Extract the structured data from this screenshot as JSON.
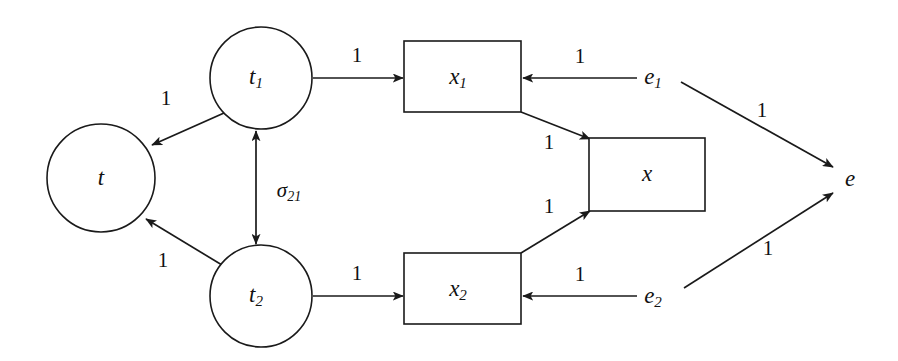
{
  "diagram": {
    "background_color": "#ffffff",
    "stroke_color": "#1a1a1a",
    "nodes": [
      {
        "id": "t",
        "shape": "circle",
        "label": "t",
        "sub": "",
        "cx": 101,
        "cy": 178,
        "r": 54
      },
      {
        "id": "t1",
        "shape": "circle",
        "label": "t",
        "sub": "1",
        "cx": 261,
        "cy": 78,
        "r": 51
      },
      {
        "id": "t2",
        "shape": "circle",
        "label": "t",
        "sub": "2",
        "cx": 261,
        "cy": 296,
        "r": 51
      },
      {
        "id": "x1",
        "shape": "rectangle",
        "label": "x",
        "sub": "1",
        "x": 404,
        "y": 41,
        "w": 117,
        "h": 71
      },
      {
        "id": "x",
        "shape": "rectangle",
        "label": "x",
        "sub": "",
        "x": 589,
        "y": 138,
        "w": 116,
        "h": 73
      },
      {
        "id": "x2",
        "shape": "rectangle",
        "label": "x",
        "sub": "2",
        "x": 404,
        "y": 253,
        "w": 117,
        "h": 71
      },
      {
        "id": "e1",
        "shape": "text",
        "label": "e",
        "sub": "1",
        "cx": 657,
        "cy": 78
      },
      {
        "id": "e2",
        "shape": "text",
        "label": "e",
        "sub": "2",
        "cx": 657,
        "cy": 297
      },
      {
        "id": "e",
        "shape": "text",
        "label": "e",
        "sub": "",
        "cx": 850,
        "cy": 180
      }
    ],
    "edges": [
      {
        "id": "t1-to-t",
        "from": "t1",
        "to": "t",
        "label": "1",
        "sub": "",
        "label_x": 166,
        "label_y": 100,
        "arrows": "end"
      },
      {
        "id": "t2-to-t",
        "from": "t2",
        "to": "t",
        "label": "1",
        "sub": "",
        "label_x": 163,
        "label_y": 262,
        "arrows": "end"
      },
      {
        "id": "t2-to-t1",
        "from": "t2",
        "to": "t1",
        "label": "σ",
        "sub": "21",
        "label_x": 289,
        "label_y": 192,
        "arrows": "both"
      },
      {
        "id": "t1-to-x1",
        "from": "t1",
        "to": "x1",
        "label": "1",
        "sub": "",
        "label_x": 357,
        "label_y": 57,
        "arrows": "end"
      },
      {
        "id": "t2-to-x2",
        "from": "t2",
        "to": "x2",
        "label": "1",
        "sub": "",
        "label_x": 357,
        "label_y": 275,
        "arrows": "end"
      },
      {
        "id": "e1-to-x1",
        "from": "e1",
        "to": "x1",
        "label": "1",
        "sub": "",
        "label_x": 580,
        "label_y": 58,
        "arrows": "end"
      },
      {
        "id": "e2-to-x2",
        "from": "e2",
        "to": "x2",
        "label": "1",
        "sub": "",
        "label_x": 580,
        "label_y": 276,
        "arrows": "end"
      },
      {
        "id": "x1-to-x",
        "from": "x1",
        "to": "x",
        "label": "1",
        "sub": "",
        "label_x": 549,
        "label_y": 144,
        "arrows": "end"
      },
      {
        "id": "x2-to-x",
        "from": "x2",
        "to": "x",
        "label": "1",
        "sub": "",
        "label_x": 549,
        "label_y": 208,
        "arrows": "end"
      },
      {
        "id": "e1-to-e",
        "from": "e1",
        "to": "e",
        "label": "1",
        "sub": "",
        "label_x": 762,
        "label_y": 112,
        "arrows": "end"
      },
      {
        "id": "e2-to-e",
        "from": "e2",
        "to": "e",
        "label": "1",
        "sub": "",
        "label_x": 768,
        "label_y": 250,
        "arrows": "end"
      }
    ]
  }
}
